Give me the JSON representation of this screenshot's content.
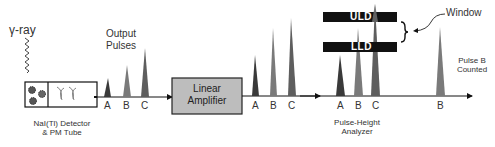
{
  "diagram": {
    "gamma_label": "γ-ray",
    "output_pulses_label": "Output\nPulses",
    "output_pulses_line1": "Output",
    "output_pulses_line2": "Pulses",
    "detector_label_line1": "NaI(Tl) Detector",
    "detector_label_line2": "& PM Tube",
    "amplifier_line1": "Linear",
    "amplifier_line2": "Amplifier",
    "analyzer_label_line1": "Pulse-Height",
    "analyzer_label_line2": "Analyzer",
    "uld_label": "ULD",
    "lld_label": "LLD",
    "window_label": "Window",
    "counted_line1": "Pulse B",
    "counted_line2": "Counted",
    "stage1_pulses": [
      "A",
      "B",
      "C"
    ],
    "stage2_pulses": [
      "A",
      "B",
      "C"
    ],
    "stage3_pulses": [
      "A",
      "B",
      "C"
    ],
    "final_pulse": "B"
  },
  "colors": {
    "pulse_a": "#3a3a3a",
    "pulse_b": "#7a7a7a",
    "pulse_c": "#5e5e5e",
    "amplifier_fill": "#bdbdbd",
    "bar_fill": "#111111"
  }
}
